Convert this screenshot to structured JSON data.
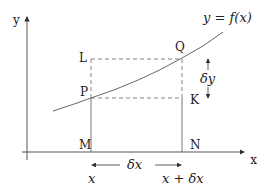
{
  "diagram": {
    "axes": {
      "x_label": "x",
      "y_label": "y"
    },
    "curve_label": "y = f(x)",
    "points": {
      "P": "P",
      "Q": "Q",
      "L": "L",
      "K": "K",
      "M": "M",
      "N": "N"
    },
    "annotations": {
      "delta_y": "δy",
      "delta_x": "δx",
      "x_left": "x",
      "x_right": "x + δx"
    },
    "colors": {
      "line": "#444444",
      "dashed": "#666666",
      "text": "#222222"
    }
  }
}
